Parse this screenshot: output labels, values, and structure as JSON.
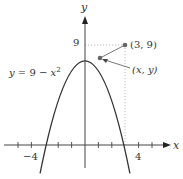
{
  "diagram": {
    "type": "function-graph",
    "function_label": {
      "y": "y",
      "eq": " = 9 − ",
      "x": "x",
      "exp": "2"
    },
    "axis_labels": {
      "x": "x",
      "y": "y"
    },
    "tick_labels": {
      "neg4": "−4",
      "pos4": "4",
      "y9": "9"
    },
    "points": {
      "corner": {
        "label": "(3, 9)"
      },
      "curve_point": {
        "label": "(x, y)"
      }
    },
    "colors": {
      "curve": "#333333",
      "axes": "#444444",
      "dotted": "#999999",
      "point": "#666666"
    }
  }
}
